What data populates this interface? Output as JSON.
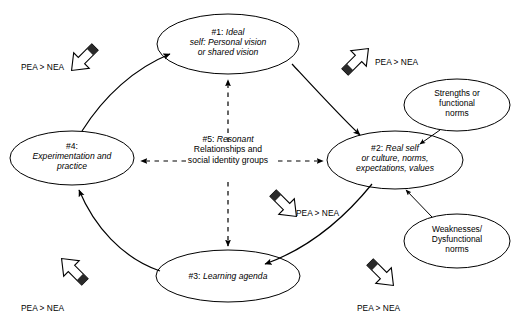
{
  "diagram": {
    "background_color": "#ffffff",
    "stroke_color": "#000000",
    "nodes": [
      {
        "id": "node-1",
        "name": "ideal-self",
        "number": "#1:",
        "line1": "Ideal",
        "line2": "self: Personal vision",
        "line3": "or shared vision"
      },
      {
        "id": "node-2",
        "name": "real-self",
        "number": "#2:",
        "line1": "Real self",
        "line2": "or culture, norms,",
        "line3": "expectations, values"
      },
      {
        "id": "node-3",
        "name": "learning-agenda",
        "number": "#3:",
        "line1": "Learning agenda",
        "line2": "",
        "line3": ""
      },
      {
        "id": "node-4",
        "name": "experimentation-and-practice",
        "number": "#4:",
        "line1": "",
        "line2": "Experimentation and",
        "line3": "practice"
      }
    ],
    "center": {
      "name": "resonant-relationships",
      "number": "#5:",
      "head": "Resonant",
      "line1": "Relationships and",
      "line2": "social identity groups"
    },
    "side_nodes": [
      {
        "id": "strengths",
        "name": "strengths-functional-norms",
        "line1": "Strengths or",
        "line2": "functional",
        "line3": "norms"
      },
      {
        "id": "weaknesses",
        "name": "weaknesses-dysfunctional-norms",
        "line1": "Weaknesses/",
        "line2": "Dysfunctional",
        "line3": "norms"
      }
    ],
    "pea_labels": [
      {
        "id": "pea-top-left",
        "text": "PEA > NEA",
        "direction": "southeast"
      },
      {
        "id": "pea-top-right",
        "text": "PEA > NEA",
        "direction": "southwest"
      },
      {
        "id": "pea-middle-right",
        "text": "PEA > NEA",
        "direction": "northwest"
      },
      {
        "id": "pea-bottom-left",
        "text": "PEA > NEA",
        "direction": "northeast"
      },
      {
        "id": "pea-bottom-right",
        "text": "PEA > NEA",
        "direction": "northwest"
      }
    ]
  }
}
